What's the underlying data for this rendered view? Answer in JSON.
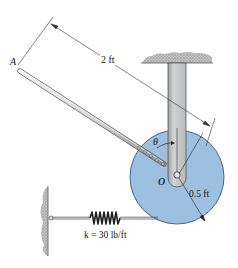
{
  "figure": {
    "labels": {
      "point_A": "A",
      "rod_length": "2 ft",
      "angle": "θ",
      "pivot_O": "O",
      "disk_radius": "0.5 ft",
      "spring_constant": "k = 30 lb/ft"
    },
    "components": [
      "ceiling-support",
      "vertical-arm",
      "disk",
      "rod",
      "spring",
      "wall"
    ],
    "colors": {
      "disk_fill": "#9dbfe0",
      "disk_stroke": "#4a6b8c",
      "arm_fill": "#c9cbcd",
      "hatch": "#b5b5b5",
      "line": "#333333"
    }
  }
}
